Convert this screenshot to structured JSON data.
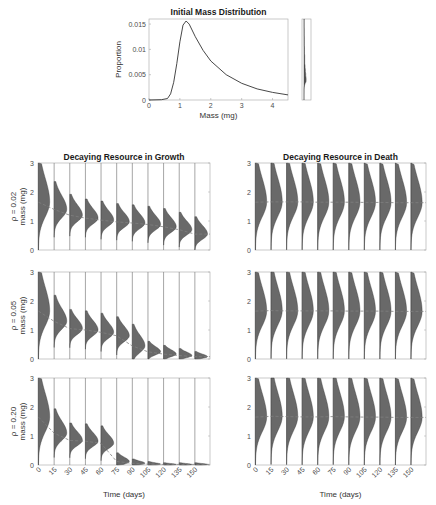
{
  "colors": {
    "axis": "#a6a6a6",
    "text": "#4d4d4d",
    "curve": "#333333",
    "violin_fill": "#595959",
    "violin_edge": "#2b2b2b",
    "mean_line": "#7f7f7f",
    "baseline": "#808080"
  },
  "chart_data": [
    {
      "id": "initial-mass",
      "type": "line",
      "title": "Initial Mass Distribution",
      "xlabel": "Mass (mg)",
      "ylabel": "Proportion",
      "xlim": [
        0,
        4.5
      ],
      "ylim": [
        0,
        0.016
      ],
      "xticks": [
        0,
        1,
        2,
        3,
        4
      ],
      "yticks": [
        0,
        0.005,
        0.01,
        0.015
      ],
      "ytick_labels": [
        "0",
        "0.005",
        "0.01",
        "0.015"
      ],
      "grid": false,
      "description": "Right-skewed (log-normal-like) distribution peaking near 1.2 mg at ~0.0155",
      "x": [
        0,
        0.4,
        0.6,
        0.7,
        0.8,
        0.9,
        1.0,
        1.1,
        1.2,
        1.3,
        1.5,
        1.75,
        2.0,
        2.5,
        3.0,
        3.5,
        4.0,
        4.5
      ],
      "y": [
        0,
        5e-05,
        0.0003,
        0.0012,
        0.0035,
        0.0072,
        0.0115,
        0.0148,
        0.0156,
        0.015,
        0.0125,
        0.0098,
        0.0077,
        0.005,
        0.0033,
        0.0022,
        0.0015,
        0.001
      ],
      "inset": {
        "description": "Narrow side panel showing the same distribution rotated vertically as a violin"
      }
    },
    {
      "id": "growth-panels",
      "type": "violin",
      "title": "Decaying Resource in Growth",
      "xlabel": "Time (days)",
      "ylabel": "mass (mg)",
      "categories": [
        "0",
        "15",
        "30",
        "45",
        "60",
        "75",
        "90",
        "105",
        "120",
        "135",
        "150"
      ],
      "ylim": [
        0,
        3
      ],
      "yticks": [
        0,
        1,
        2,
        3
      ],
      "series": [
        {
          "name": "ρ = 0.02",
          "mean": [
            1.65,
            1.4,
            1.2,
            1.1,
            1.03,
            0.97,
            0.93,
            0.88,
            0.8,
            0.7,
            0.55
          ],
          "spread": [
            0.55,
            0.32,
            0.24,
            0.22,
            0.22,
            0.21,
            0.21,
            0.21,
            0.21,
            0.2,
            0.2
          ]
        },
        {
          "name": "ρ = 0.05",
          "mean": [
            1.65,
            1.3,
            1.05,
            1.0,
            0.92,
            0.8,
            0.45,
            0.25,
            0.17,
            0.12,
            0.08
          ],
          "spread": [
            0.55,
            0.3,
            0.22,
            0.22,
            0.22,
            0.22,
            0.25,
            0.12,
            0.1,
            0.08,
            0.06
          ]
        },
        {
          "name": "ρ = 0.20",
          "mean": [
            1.65,
            1.1,
            0.85,
            0.82,
            0.75,
            0.12,
            0.06,
            0.03,
            0.02,
            0.02,
            0.02
          ],
          "spread": [
            0.55,
            0.28,
            0.2,
            0.2,
            0.2,
            0.1,
            0.05,
            0.03,
            0.02,
            0.02,
            0.02
          ]
        }
      ]
    },
    {
      "id": "death-panels",
      "type": "violin",
      "title": "Decaying Resource in Death",
      "xlabel": "Time (days)",
      "ylabel": "mass (mg)",
      "categories": [
        "0",
        "15",
        "30",
        "45",
        "60",
        "75",
        "90",
        "105",
        "120",
        "135",
        "150"
      ],
      "ylim": [
        0,
        3
      ],
      "yticks": [
        0,
        1,
        2,
        3
      ],
      "series": [
        {
          "name": "ρ = 0.02",
          "mean": [
            1.65,
            1.66,
            1.66,
            1.66,
            1.65,
            1.65,
            1.65,
            1.64,
            1.64,
            1.63,
            1.63
          ],
          "spread": [
            0.55,
            0.55,
            0.55,
            0.55,
            0.55,
            0.55,
            0.55,
            0.55,
            0.55,
            0.55,
            0.55
          ]
        },
        {
          "name": "ρ = 0.05",
          "mean": [
            1.65,
            1.67,
            1.66,
            1.66,
            1.66,
            1.66,
            1.65,
            1.65,
            1.65,
            1.64,
            1.64
          ],
          "spread": [
            0.55,
            0.55,
            0.55,
            0.55,
            0.55,
            0.55,
            0.55,
            0.55,
            0.55,
            0.55,
            0.55
          ]
        },
        {
          "name": "ρ = 0.20",
          "mean": [
            1.65,
            1.68,
            1.67,
            1.66,
            1.66,
            1.67,
            1.66,
            1.65,
            1.65,
            1.64,
            1.64
          ],
          "spread": [
            0.55,
            0.55,
            0.55,
            0.55,
            0.55,
            0.55,
            0.55,
            0.55,
            0.55,
            0.55,
            0.55
          ]
        }
      ]
    }
  ],
  "rows": [
    {
      "rho_label": "ρ = 0.02",
      "ylabel": "mass (mg)"
    },
    {
      "rho_label": "ρ = 0.05",
      "ylabel": "mass (mg)"
    },
    {
      "rho_label": "ρ = 0.20",
      "ylabel": "mass (mg)"
    }
  ],
  "layout": {
    "top": {
      "x0": 149,
      "y0": 19,
      "x1": 288,
      "y1": 100
    },
    "inset": {
      "x0": 302,
      "y0": 19,
      "x1": 311,
      "y1": 100
    },
    "left_col": {
      "x0": 38,
      "x1": 210
    },
    "right_col": {
      "x0": 255,
      "x1": 426
    },
    "row_y": [
      [
        163,
        250
      ],
      [
        272,
        359
      ],
      [
        378,
        465
      ]
    ]
  }
}
